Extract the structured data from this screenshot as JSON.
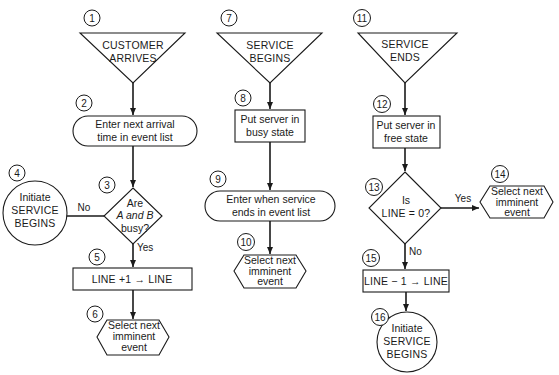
{
  "diagram": {
    "nodes": {
      "n1": {
        "number": "1",
        "shape": "triangle",
        "lines": [
          "CUSTOMER",
          "ARRIVES"
        ]
      },
      "n2": {
        "number": "2",
        "shape": "rounded-rect",
        "lines": [
          "Enter next arrival",
          "time in event list"
        ]
      },
      "n3": {
        "number": "3",
        "shape": "diamond",
        "lines": [
          "Are",
          "A and B",
          "busy?"
        ]
      },
      "n4": {
        "number": "4",
        "shape": "circle",
        "lines": [
          "Initiate",
          "SERVICE",
          "BEGINS"
        ]
      },
      "n5": {
        "number": "5",
        "shape": "rect",
        "lines": [
          "LINE +1 → LINE"
        ]
      },
      "n6": {
        "number": "6",
        "shape": "hexagon",
        "lines": [
          "Select next",
          "imminent",
          "event"
        ]
      },
      "n7": {
        "number": "7",
        "shape": "triangle",
        "lines": [
          "SERVICE",
          "BEGINS"
        ]
      },
      "n8": {
        "number": "8",
        "shape": "rect",
        "lines": [
          "Put server in",
          "busy state"
        ]
      },
      "n9": {
        "number": "9",
        "shape": "rounded-rect",
        "lines": [
          "Enter when service",
          "ends in event list"
        ]
      },
      "n10": {
        "number": "10",
        "shape": "hexagon",
        "lines": [
          "Select next",
          "imminent",
          "event"
        ]
      },
      "n11": {
        "number": "11",
        "shape": "triangle",
        "lines": [
          "SERVICE",
          "ENDS"
        ]
      },
      "n12": {
        "number": "12",
        "shape": "rect",
        "lines": [
          "Put server in",
          "free state"
        ]
      },
      "n13": {
        "number": "13",
        "shape": "diamond",
        "lines": [
          "Is",
          "LINE = 0?"
        ]
      },
      "n14": {
        "number": "14",
        "shape": "hexagon",
        "lines": [
          "Select next",
          "imminent",
          "event"
        ]
      },
      "n15": {
        "number": "15",
        "shape": "rect",
        "lines": [
          "LINE − 1 → LINE"
        ]
      },
      "n16": {
        "number": "16",
        "shape": "circle",
        "lines": [
          "Initiate",
          "SERVICE",
          "BEGINS"
        ]
      }
    },
    "edge_labels": {
      "n3_no": "No",
      "n3_yes": "Yes",
      "n13_yes": "Yes",
      "n13_no": "No"
    },
    "colors": {
      "stroke": "#1a1a1a",
      "background": "#ffffff"
    }
  }
}
